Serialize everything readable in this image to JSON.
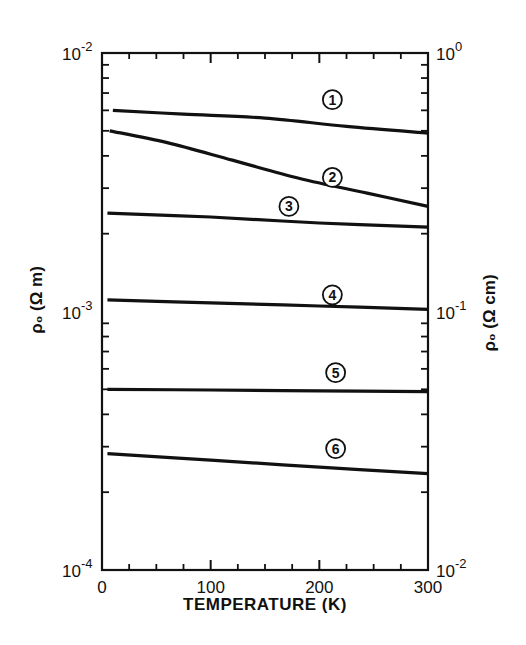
{
  "chart_data": {
    "type": "line",
    "title": "",
    "xlabel": "TEMPERATURE (K)",
    "ylabel_left": "ρ₀ (Ω m)",
    "ylabel_right": "ρ₀ (Ω cm)",
    "xlim": [
      0,
      300
    ],
    "ylim_left": [
      0.0001,
      0.01
    ],
    "ylim_right": [
      0.01,
      1
    ],
    "yscale": "log",
    "grid": false,
    "x_ticks": [
      0,
      100,
      200,
      300
    ],
    "x_minor_ticks": [
      25,
      50,
      75,
      125,
      150,
      175,
      225,
      250,
      275
    ],
    "y_left_tick_labels": [
      {
        "value": 0.01,
        "base": "10",
        "exp": "-2"
      },
      {
        "value": 0.001,
        "base": "10",
        "exp": "-3"
      },
      {
        "value": 0.0001,
        "base": "10",
        "exp": "-4"
      }
    ],
    "y_right_tick_labels": [
      {
        "value": 0.01,
        "base": "10",
        "exp": "0"
      },
      {
        "value": 0.001,
        "base": "10",
        "exp": "-1"
      },
      {
        "value": 0.0001,
        "base": "10",
        "exp": "-2"
      }
    ],
    "series": [
      {
        "name": "1",
        "label_pos": [
          212,
          0.0066
        ],
        "x": [
          10,
          75,
          150,
          225,
          300
        ],
        "values": [
          0.006,
          0.0058,
          0.0056,
          0.0052,
          0.0049
        ]
      },
      {
        "name": "2",
        "label_pos": [
          212,
          0.0033
        ],
        "x": [
          7,
          60,
          120,
          182,
          244,
          300
        ],
        "values": [
          0.005,
          0.0045,
          0.00385,
          0.00327,
          0.00287,
          0.00255
        ]
      },
      {
        "name": "3",
        "label_pos": [
          172,
          0.00255
        ],
        "x": [
          5,
          100,
          200,
          300
        ],
        "values": [
          0.0024,
          0.00232,
          0.0022,
          0.00212
        ]
      },
      {
        "name": "4",
        "label_pos": [
          212,
          0.00116
        ],
        "x": [
          5,
          100,
          200,
          300
        ],
        "values": [
          0.00111,
          0.00108,
          0.00105,
          0.00102
        ]
      },
      {
        "name": "5",
        "label_pos": [
          215,
          0.00058
        ],
        "x": [
          5,
          100,
          200,
          300
        ],
        "values": [
          0.0005,
          0.000497,
          0.000493,
          0.00049
        ]
      },
      {
        "name": "6",
        "label_pos": [
          215,
          0.000295
        ],
        "x": [
          5,
          100,
          200,
          300
        ],
        "values": [
          0.000282,
          0.000266,
          0.00025,
          0.000236
        ]
      }
    ]
  }
}
